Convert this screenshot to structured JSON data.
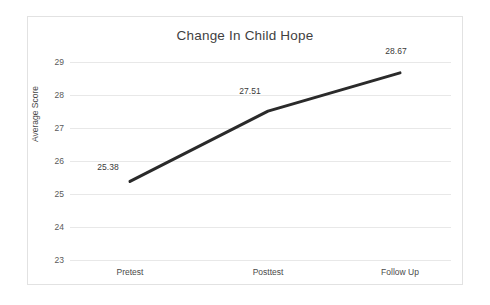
{
  "chart_data": {
    "type": "line",
    "title": "Change In Child Hope",
    "xlabel": "",
    "ylabel": "Average Score",
    "categories": [
      "Pretest",
      "Posttest",
      "Follow Up"
    ],
    "values": [
      25.38,
      27.51,
      28.67
    ],
    "point_labels": [
      "25.38",
      "27.51",
      "28.67"
    ],
    "ylim": [
      23,
      29
    ],
    "yticks": [
      29,
      28,
      27,
      26,
      25,
      24,
      23
    ],
    "ytick_labels": [
      "29",
      "28",
      "27",
      "26",
      "25",
      "24",
      "23"
    ],
    "grid": true,
    "legend": "none",
    "series": [
      {
        "name": "Average Score",
        "values": [
          25.38,
          27.51,
          28.67
        ],
        "color": "#2a2a2a"
      }
    ],
    "colors": {
      "line": "#2a2a2a",
      "gridline": "#e8e8e8",
      "frame": "#e2e2e2",
      "title_text": "#3f3f3f",
      "tick_text": "#5a5a5a",
      "background": "#ffffff"
    }
  }
}
